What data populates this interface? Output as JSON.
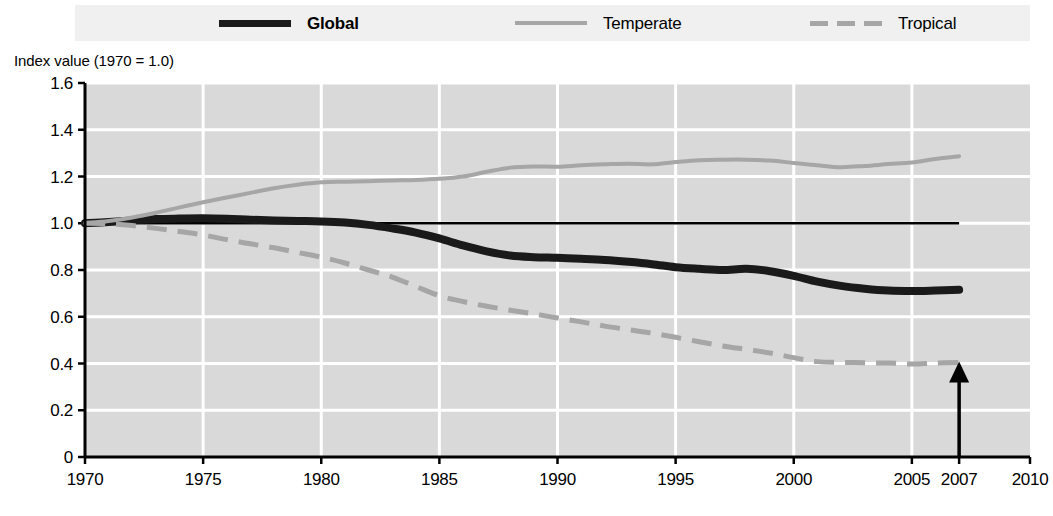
{
  "legend": {
    "entries": [
      {
        "label": "Global",
        "style": "solid-bold-black",
        "color": "#1a1a1a"
      },
      {
        "label": "Temperate",
        "style": "solid-gray",
        "color": "#a6a6a6"
      },
      {
        "label": "Tropical",
        "style": "dashed-gray",
        "color": "#a6a6a6"
      }
    ]
  },
  "axis": {
    "y_title": "Index value (1970 = 1.0)",
    "y_ticks": [
      "1.6",
      "1.4",
      "1.2",
      "1.0",
      "0.8",
      "0.6",
      "0.4",
      "0.2",
      "0"
    ],
    "x_ticks": [
      "1970",
      "1975",
      "1980",
      "1985",
      "1990",
      "1995",
      "2000",
      "2005",
      "2007",
      "2010"
    ]
  },
  "colors": {
    "plot_background": "#d9d9d9",
    "gridline": "#ffffff",
    "axis": "#000000",
    "global_line": "#1a1a1a",
    "temperate_line": "#a6a6a6",
    "tropical_line": "#a6a6a6",
    "reference_line": "#000000",
    "legend_band": "#f0f0f0"
  },
  "annotation": {
    "arrow_year": "2007",
    "arrow_label": "2007"
  },
  "chart_data": {
    "type": "line",
    "title": "",
    "subtitle": "",
    "xlabel": "",
    "ylabel": "Index value (1970 = 1.0)",
    "xlim": [
      1970,
      2010
    ],
    "ylim": [
      0,
      1.6
    ],
    "grid": true,
    "legend_position": "top",
    "x_tick_values": [
      1970,
      1975,
      1980,
      1985,
      1990,
      1995,
      2000,
      2005,
      2007,
      2010
    ],
    "y_tick_values": [
      0,
      0.2,
      0.4,
      0.6,
      0.8,
      1.0,
      1.2,
      1.4,
      1.6
    ],
    "reference_line": {
      "y": 1.0,
      "from_x": 1970,
      "to_x": 2007,
      "color": "#000000"
    },
    "annotations": [
      {
        "type": "arrow",
        "x": 2007,
        "y_from": 0.0,
        "y_to": 0.4,
        "label": "2007"
      }
    ],
    "x": [
      1970,
      1971,
      1972,
      1973,
      1974,
      1975,
      1976,
      1977,
      1978,
      1979,
      1980,
      1981,
      1982,
      1983,
      1984,
      1985,
      1986,
      1987,
      1988,
      1989,
      1990,
      1991,
      1992,
      1993,
      1994,
      1995,
      1996,
      1997,
      1998,
      1999,
      2000,
      2001,
      2002,
      2003,
      2004,
      2005,
      2006,
      2007
    ],
    "series": [
      {
        "name": "Global",
        "color": "#1a1a1a",
        "style": "solid",
        "values": [
          1.0,
          1.005,
          1.012,
          1.018,
          1.02,
          1.021,
          1.019,
          1.015,
          1.012,
          1.01,
          1.008,
          1.003,
          0.993,
          0.978,
          0.96,
          0.935,
          0.905,
          0.88,
          0.862,
          0.855,
          0.852,
          0.848,
          0.843,
          0.835,
          0.825,
          0.812,
          0.805,
          0.8,
          0.805,
          0.795,
          0.775,
          0.75,
          0.732,
          0.72,
          0.712,
          0.71,
          0.712,
          0.715
        ]
      },
      {
        "name": "Temperate",
        "color": "#a6a6a6",
        "style": "solid",
        "values": [
          1.0,
          1.01,
          1.025,
          1.045,
          1.068,
          1.09,
          1.11,
          1.13,
          1.15,
          1.165,
          1.175,
          1.178,
          1.18,
          1.183,
          1.185,
          1.19,
          1.2,
          1.22,
          1.238,
          1.243,
          1.242,
          1.248,
          1.252,
          1.255,
          1.252,
          1.262,
          1.27,
          1.272,
          1.272,
          1.268,
          1.258,
          1.248,
          1.24,
          1.245,
          1.253,
          1.26,
          1.275,
          1.287
        ]
      },
      {
        "name": "Tropical",
        "color": "#a6a6a6",
        "style": "dashed",
        "values": [
          1.0,
          0.998,
          0.99,
          0.978,
          0.965,
          0.95,
          0.93,
          0.912,
          0.895,
          0.875,
          0.855,
          0.83,
          0.8,
          0.77,
          0.73,
          0.69,
          0.665,
          0.645,
          0.628,
          0.612,
          0.595,
          0.578,
          0.56,
          0.545,
          0.53,
          0.512,
          0.493,
          0.475,
          0.46,
          0.445,
          0.425,
          0.408,
          0.405,
          0.403,
          0.402,
          0.398,
          0.402,
          0.404
        ]
      }
    ]
  },
  "caption": {
    "text": ""
  }
}
